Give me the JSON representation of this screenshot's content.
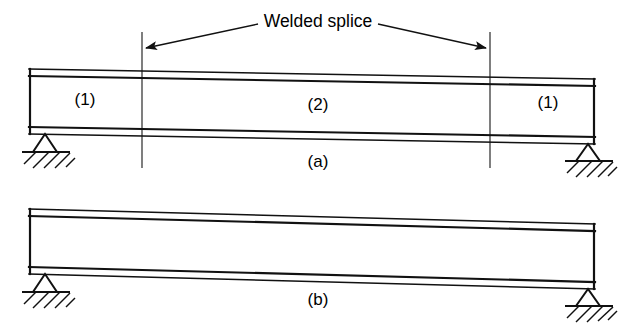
{
  "figure": {
    "title_annotation": "Welded splice",
    "panels": [
      {
        "caption": "(a)",
        "description": "Simply supported beam with welded splice, three segments",
        "segments": [
          {
            "label": "(1)",
            "position": "left"
          },
          {
            "label": "(2)",
            "position": "middle"
          },
          {
            "label": "(1)",
            "position": "right"
          }
        ],
        "supports": [
          "pin-left",
          "roller-right"
        ],
        "splice_markers": 2
      },
      {
        "caption": "(b)",
        "description": "Simply supported uniform beam, no splice",
        "segments": [],
        "supports": [
          "pin-left",
          "roller-right"
        ],
        "splice_markers": 0
      }
    ]
  },
  "labels": {
    "welded_splice": "Welded splice",
    "segment_1_left": "(1)",
    "segment_2": "(2)",
    "segment_1_right": "(1)",
    "caption_a": "(a)",
    "caption_b": "(b)"
  },
  "colors": {
    "line": "#111111",
    "splice_line": "#3a3a3a",
    "background": "#ffffff"
  }
}
